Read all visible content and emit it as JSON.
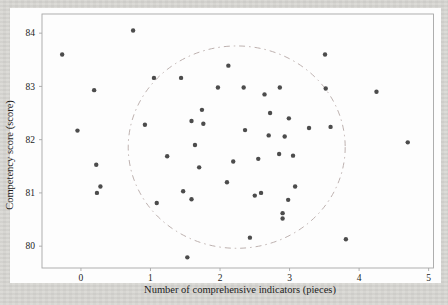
{
  "page": {
    "background_color": "#d8d7d3",
    "figure_background_color": "#fdfdfd"
  },
  "chart_data": {
    "type": "scatter",
    "title": "",
    "xlabel": "Number of comprehensive indicators (pieces)",
    "ylabel": "Competency score (score)",
    "x_ticks": [
      0,
      1,
      2,
      3,
      4,
      5
    ],
    "y_ticks": [
      80,
      81,
      82,
      83,
      84
    ],
    "xlim": [
      -0.56,
      5.07
    ],
    "ylim": [
      79.59,
      84.36
    ],
    "grid": false,
    "legend": "none",
    "marker": "dot",
    "point_color": "#3d3d3d",
    "frame_color": "#a6a6a6",
    "text_color": "#1c1c1c",
    "ellipse": {
      "cx": 2.24,
      "cy": 81.86,
      "rx": 1.56,
      "ry": 1.9,
      "style": "dash-dot",
      "color": "#b5a8a6"
    },
    "points": [
      [
        0.75,
        84.05
      ],
      [
        -0.27,
        83.6
      ],
      [
        3.51,
        83.6
      ],
      [
        2.12,
        83.39
      ],
      [
        1.05,
        83.16
      ],
      [
        1.44,
        83.16
      ],
      [
        0.19,
        82.93
      ],
      [
        1.97,
        82.98
      ],
      [
        2.34,
        82.98
      ],
      [
        2.64,
        82.85
      ],
      [
        2.86,
        82.98
      ],
      [
        3.52,
        82.96
      ],
      [
        4.25,
        82.9
      ],
      [
        1.74,
        82.56
      ],
      [
        2.72,
        82.5
      ],
      [
        2.99,
        82.4
      ],
      [
        1.59,
        82.35
      ],
      [
        1.76,
        82.3
      ],
      [
        0.92,
        82.28
      ],
      [
        2.36,
        82.18
      ],
      [
        3.28,
        82.22
      ],
      [
        3.59,
        82.24
      ],
      [
        -0.05,
        82.17
      ],
      [
        2.7,
        82.08
      ],
      [
        2.93,
        82.06
      ],
      [
        1.64,
        81.9
      ],
      [
        4.7,
        81.95
      ],
      [
        2.19,
        81.59
      ],
      [
        2.55,
        81.64
      ],
      [
        2.85,
        81.73
      ],
      [
        3.05,
        81.7
      ],
      [
        1.24,
        81.69
      ],
      [
        1.7,
        81.48
      ],
      [
        0.22,
        81.53
      ],
      [
        2.1,
        81.2
      ],
      [
        3.08,
        81.12
      ],
      [
        0.28,
        81.12
      ],
      [
        0.23,
        81.0
      ],
      [
        1.47,
        81.03
      ],
      [
        1.59,
        80.88
      ],
      [
        1.09,
        80.81
      ],
      [
        2.5,
        80.95
      ],
      [
        2.59,
        81.0
      ],
      [
        2.98,
        80.87
      ],
      [
        2.9,
        80.62
      ],
      [
        2.9,
        80.52
      ],
      [
        2.43,
        80.16
      ],
      [
        3.81,
        80.13
      ],
      [
        1.53,
        79.79
      ]
    ]
  }
}
